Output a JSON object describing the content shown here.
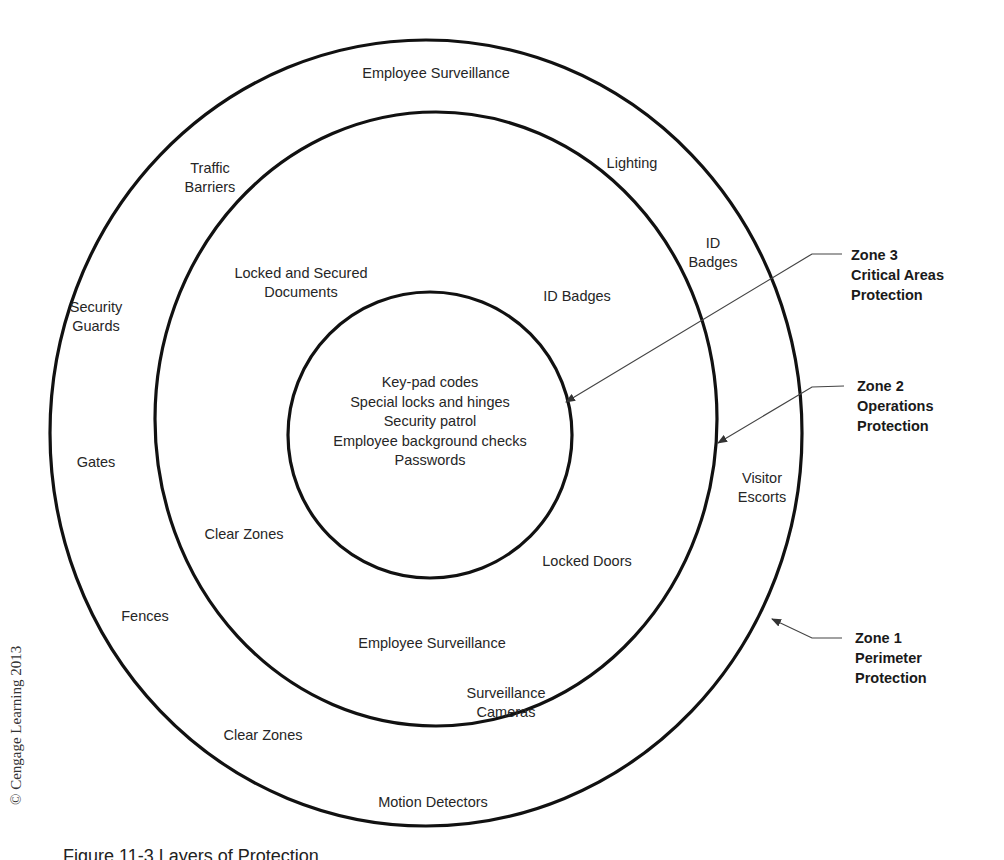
{
  "diagram": {
    "title": "Layers of Protection",
    "rings": [
      {
        "id": "outer",
        "cx": 426,
        "cy": 433,
        "rx": 376,
        "ry": 393
      },
      {
        "id": "middle",
        "cx": 436,
        "cy": 419,
        "rx": 281,
        "ry": 307
      },
      {
        "id": "inner",
        "cx": 430,
        "cy": 435,
        "rx": 142,
        "ry": 143
      }
    ],
    "zone1_labels": {
      "employee_surveillance": "Employee Surveillance",
      "traffic_barriers": "Traffic\nBarriers",
      "lighting": "Lighting",
      "id_badges": "ID\nBadges",
      "security_guards": "Security\nGuards",
      "gates": "Gates",
      "visitor_escorts": "Visitor\nEscorts",
      "fences": "Fences",
      "surveillance_cameras": "Surveillance\nCameras",
      "clear_zones": "Clear Zones",
      "motion_detectors": "Motion Detectors"
    },
    "zone2_labels": {
      "locked_documents": "Locked and Secured\nDocuments",
      "id_badges": "ID Badges",
      "clear_zones": "Clear Zones",
      "locked_doors": "Locked Doors",
      "employee_surveillance": "Employee Surveillance"
    },
    "zone3_items": "Key-pad codes\nSpecial locks and hinges\nSecurity patrol\nEmployee background checks\nPasswords",
    "callouts": {
      "zone3": "Zone 3\nCritical Areas\nProtection",
      "zone2": "Zone 2\nOperations\nProtection",
      "zone1": "Zone 1\nPerimeter\nProtection"
    },
    "copyright": "© Cengage Learning 2013",
    "caption": "Figure 11-3  Layers of Protection"
  }
}
